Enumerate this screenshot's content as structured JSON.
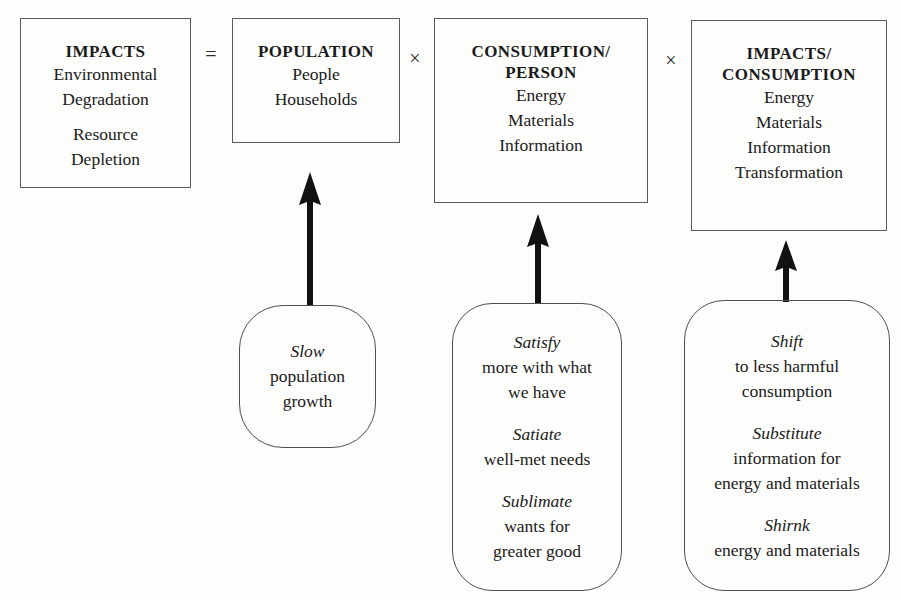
{
  "diagram": {
    "stroke_color": "#4f4f4f",
    "text_color": "#1a1a1a",
    "background_color": "#fdfdfc"
  },
  "terms": [
    {
      "id": "impacts",
      "title": "IMPACTS",
      "groups": [
        [
          "Environmental",
          "Degradation"
        ],
        [
          "Resource",
          "Depletion"
        ]
      ]
    },
    {
      "id": "population",
      "title": "POPULATION",
      "groups": [
        [
          "People",
          "Households"
        ]
      ]
    },
    {
      "id": "consumption-per-person",
      "title": "CONSUMPTION/\nPERSON",
      "groups": [
        [
          "Energy",
          "Materials",
          "Information"
        ]
      ]
    },
    {
      "id": "impacts-per-consumption",
      "title": "IMPACTS/\nCONSUMPTION",
      "groups": [
        [
          "Energy",
          "Materials",
          "Information",
          "Transformation"
        ]
      ]
    }
  ],
  "operators": [
    {
      "id": "equals",
      "symbol": "="
    },
    {
      "id": "times-1",
      "symbol": "×"
    },
    {
      "id": "times-2",
      "symbol": "×"
    }
  ],
  "strategies": [
    {
      "id": "population-strategy",
      "groups": [
        {
          "key": "Slow",
          "lines": [
            "population",
            "growth"
          ]
        }
      ]
    },
    {
      "id": "consumption-strategy",
      "groups": [
        {
          "key": "Satisfy",
          "lines": [
            "more with what",
            "we have"
          ]
        },
        {
          "key": "Satiate",
          "lines": [
            "well-met needs"
          ]
        },
        {
          "key": "Sublimate",
          "lines": [
            "wants for",
            "greater good"
          ]
        }
      ]
    },
    {
      "id": "impacts-strategy",
      "groups": [
        {
          "key": "Shift",
          "lines": [
            "to less harmful",
            "consumption"
          ]
        },
        {
          "key": "Substitute",
          "lines": [
            "information for",
            "energy and materials"
          ]
        },
        {
          "key": "Shirnk",
          "lines": [
            "energy and materials"
          ]
        }
      ]
    }
  ],
  "arrows": [
    {
      "id": "arrow-population",
      "from": "population-strategy",
      "to": "population"
    },
    {
      "id": "arrow-consumption",
      "from": "consumption-strategy",
      "to": "consumption-per-person"
    },
    {
      "id": "arrow-impacts",
      "from": "impacts-strategy",
      "to": "impacts-per-consumption"
    }
  ]
}
